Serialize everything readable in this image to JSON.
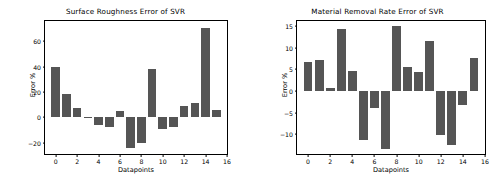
{
  "figure": {
    "background": "#ffffff",
    "bar_color": "#555555",
    "axis_color": "#000000"
  },
  "chart_data": [
    {
      "type": "bar",
      "title": "Surface Roughness Error of SVR",
      "xlabel": "Datapoints",
      "ylabel": "Error %",
      "categories": [
        0,
        1,
        2,
        3,
        4,
        5,
        6,
        7,
        8,
        9,
        10,
        11,
        12,
        13,
        14,
        15
      ],
      "values": [
        39.5,
        18.0,
        7.0,
        -0.3,
        -6.0,
        -7.5,
        5.0,
        -24.5,
        -20.5,
        38.0,
        -9.0,
        -7.5,
        9.0,
        11.0,
        70.5,
        6.0
      ],
      "xlim": [
        -1,
        16
      ],
      "ylim": [
        -29,
        76
      ],
      "xticks": [
        0,
        2,
        4,
        6,
        8,
        10,
        12,
        14,
        16
      ],
      "yticks": [
        -20,
        0,
        20,
        40,
        60
      ],
      "grid": false,
      "legend": null,
      "bar_color": "#555555"
    },
    {
      "type": "bar",
      "title": "Material Removal Rate Error of SVR",
      "xlabel": "Datapoints",
      "ylabel": "Error %",
      "categories": [
        0,
        1,
        2,
        3,
        4,
        5,
        6,
        7,
        8,
        9,
        10,
        11,
        12,
        13,
        14,
        15
      ],
      "values": [
        6.8,
        7.2,
        0.6,
        14.3,
        4.7,
        -11.3,
        -3.9,
        -13.4,
        15.0,
        5.5,
        4.3,
        11.6,
        -10.3,
        -12.5,
        -3.3,
        7.6
      ],
      "xlim": [
        -1,
        16
      ],
      "ylim": [
        -14.6,
        16.2
      ],
      "xticks": [
        0,
        2,
        4,
        6,
        8,
        10,
        12,
        14,
        16
      ],
      "yticks": [
        -10,
        -5,
        0,
        5,
        10,
        15
      ],
      "grid": false,
      "legend": null,
      "bar_color": "#555555"
    }
  ]
}
